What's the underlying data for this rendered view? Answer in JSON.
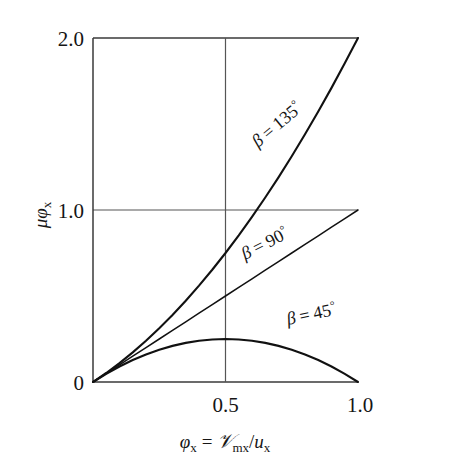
{
  "chart_data": {
    "type": "line",
    "title": "",
    "xlabel": "φx = 𝒱mx/ux",
    "ylabel": "μφx",
    "xlim": [
      0,
      1.0
    ],
    "ylim": [
      0,
      2.0
    ],
    "grid": true,
    "legend_position": "inline-curve-labels",
    "x_ticks": [
      "0",
      "0.5",
      "1.0"
    ],
    "x_tick_values": [
      0,
      0.5,
      1.0
    ],
    "y_ticks": [
      "0",
      "1.0",
      "2.0"
    ],
    "y_tick_values": [
      0,
      1.0,
      2.0
    ],
    "x": [
      0,
      0.05,
      0.1,
      0.15,
      0.2,
      0.25,
      0.3,
      0.35,
      0.4,
      0.45,
      0.5,
      0.55,
      0.6,
      0.65,
      0.7,
      0.75,
      0.8,
      0.85,
      0.9,
      0.95,
      1.0
    ],
    "series": [
      {
        "name": "β = 135°",
        "label": "β = 135°",
        "beta_deg": 135,
        "formula": "μφx = φx (1 + φx)",
        "values": [
          0,
          0.0525,
          0.11,
          0.1725,
          0.24,
          0.3125,
          0.39,
          0.4725,
          0.56,
          0.6525,
          0.75,
          0.8525,
          0.96,
          1.0725,
          1.19,
          1.3125,
          1.44,
          1.5725,
          1.71,
          1.8525,
          2.0
        ]
      },
      {
        "name": "β = 90°",
        "label": "β = 90°",
        "beta_deg": 90,
        "formula": "μφx = φx",
        "values": [
          0,
          0.05,
          0.1,
          0.15,
          0.2,
          0.25,
          0.3,
          0.35,
          0.4,
          0.45,
          0.5,
          0.55,
          0.6,
          0.65,
          0.7,
          0.75,
          0.8,
          0.85,
          0.9,
          0.95,
          1.0
        ]
      },
      {
        "name": "β = 45°",
        "label": "β = 45°",
        "beta_deg": 45,
        "formula": "μφx = φx (1 − φx)",
        "values": [
          0,
          0.0475,
          0.09,
          0.1275,
          0.16,
          0.1875,
          0.21,
          0.2275,
          0.24,
          0.2475,
          0.25,
          0.2475,
          0.24,
          0.2275,
          0.21,
          0.1875,
          0.16,
          0.1275,
          0.09,
          0.0475,
          0
        ]
      }
    ],
    "annotations": [
      {
        "text": "β = 135°",
        "at_x": 0.62,
        "at_y": 1.0,
        "rotation_deg": -40
      },
      {
        "text": "β = 90°",
        "at_x": 0.68,
        "at_y": 0.5,
        "rotation_deg": -25
      },
      {
        "text": "β = 45°",
        "at_x": 0.72,
        "at_y": 0.22,
        "rotation_deg": -12
      }
    ]
  },
  "axes": {
    "y_label_parts": {
      "mu": "μ",
      "phi": "φ",
      "sub": "x"
    },
    "x_label_parts": {
      "phi": "φ",
      "phi_sub": "x",
      "equals": "=",
      "script_v": "𝒱",
      "v_sub": "mx",
      "slash": "/",
      "u": "u",
      "u_sub": "x"
    },
    "y_ticks": [
      {
        "label": "2.0",
        "value": 2.0
      },
      {
        "label": "1.0",
        "value": 1.0
      },
      {
        "label": "0",
        "value": 0
      }
    ],
    "x_ticks": [
      {
        "label": "0",
        "value": 0
      },
      {
        "label": "0.5",
        "value": 0.5
      },
      {
        "label": "1.0",
        "value": 1.0
      }
    ]
  },
  "curve_labels": [
    {
      "id": "beta-135",
      "text": "β = 135°",
      "beta": "β",
      "equals": "=",
      "value": "135",
      "degree": "°"
    },
    {
      "id": "beta-90",
      "text": "β = 90°",
      "beta": "β",
      "equals": "=",
      "value": "90",
      "degree": "°"
    },
    {
      "id": "beta-45",
      "text": "β = 45°",
      "beta": "β",
      "equals": "=",
      "value": "45",
      "degree": "°"
    }
  ],
  "colors": {
    "curve": "#111111",
    "frame": "#3a3a3a",
    "grid": "#555555",
    "background": "#ffffff",
    "text": "#151515"
  }
}
